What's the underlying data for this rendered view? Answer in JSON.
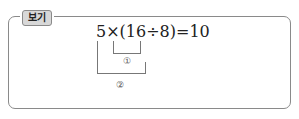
{
  "header": {
    "tab_label": "보기"
  },
  "equation": {
    "text": "5×(16÷8)=10"
  },
  "annotations": [
    {
      "marker": "①",
      "covers": "16÷8"
    },
    {
      "marker": "②",
      "covers": "5×(16÷8)"
    }
  ]
}
